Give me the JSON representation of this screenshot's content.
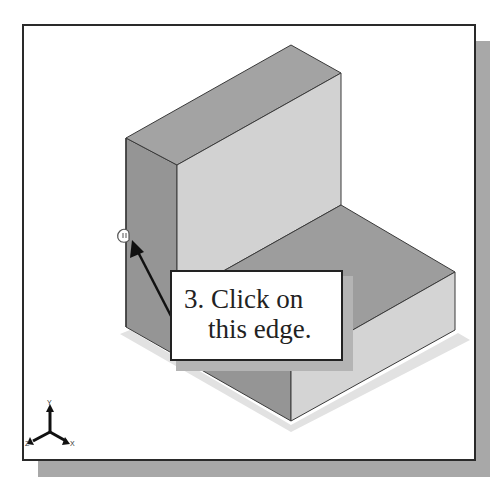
{
  "figure": {
    "type": "cad-viewport-illustration",
    "model": "L-shaped solid block (isometric view)",
    "colors": {
      "frame_border": "#2a2a2a",
      "frame_shadow": "#a8a8a8",
      "top_face": "#a3a3a3",
      "left_face": "#959595",
      "front_face": "#d2d2d2",
      "base_top_face": "#9d9d9d",
      "base_front_face": "#d4d4d4",
      "edge": "#3a3a3a"
    }
  },
  "callout": {
    "line1": "3. Click on",
    "line2": "this edge.",
    "arrow_target": "vertical left edge of block"
  },
  "cursor": {
    "icon": "pick-cursor-icon"
  },
  "axis_triad": {
    "y_label": "Y",
    "x_label": "X",
    "z_label": "Z"
  }
}
